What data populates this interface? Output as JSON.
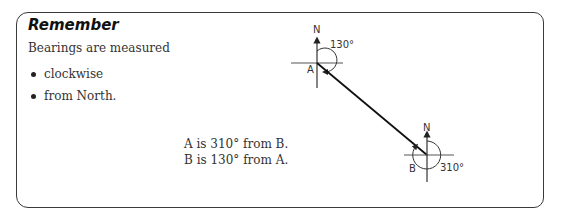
{
  "panel": {
    "title": "Remember",
    "intro": "Bearings are measured",
    "bullets": [
      "clockwise",
      "from North."
    ]
  },
  "statements": [
    "A is 310° from B.",
    "B is 130° from A."
  ],
  "diagram": {
    "point_a": {
      "label": "A",
      "north_label": "N",
      "bearing_label": "130°"
    },
    "point_b": {
      "label": "B",
      "north_label": "N",
      "bearing_label": "310°"
    }
  }
}
